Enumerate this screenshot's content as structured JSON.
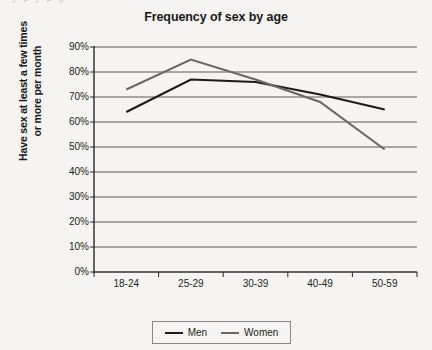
{
  "page": {
    "bleed_text": "y p y p g",
    "background_color": "#f5f4f2"
  },
  "chart_data": {
    "type": "line",
    "title": "Frequency of sex by age",
    "xlabel": "",
    "ylabel": "Have sex at least a few times or more per month",
    "ylabel_line1": "Have sex at least a few times",
    "ylabel_line2": "or more per month",
    "categories": [
      "18-24",
      "25-29",
      "30-39",
      "40-49",
      "50-59"
    ],
    "ylim": [
      0,
      90
    ],
    "ytick_labels": [
      "90%",
      "80%",
      "70%",
      "60%",
      "50%",
      "40%",
      "30%",
      "20%",
      "10%",
      "0%"
    ],
    "ytick_values": [
      90,
      80,
      70,
      60,
      50,
      40,
      30,
      20,
      10,
      0
    ],
    "grid": true,
    "grid_axis": "y",
    "legend_position": "bottom",
    "series": [
      {
        "name": "Men",
        "color": "#1c1a1b",
        "values": [
          64,
          77,
          76,
          71,
          65
        ]
      },
      {
        "name": "Women",
        "color": "#6a6866",
        "values": [
          73,
          85,
          77,
          68,
          49
        ]
      }
    ]
  }
}
